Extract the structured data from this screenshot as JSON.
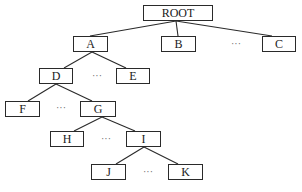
{
  "diagram": {
    "type": "tree",
    "nodes": [
      {
        "id": "root",
        "label": "ROOT",
        "x": 143,
        "y": 5,
        "w": 70,
        "h": 16
      },
      {
        "id": "a",
        "label": "A",
        "x": 73,
        "y": 36,
        "w": 35,
        "h": 16
      },
      {
        "id": "b",
        "label": "B",
        "x": 161,
        "y": 36,
        "w": 35,
        "h": 16
      },
      {
        "id": "c",
        "label": "C",
        "x": 262,
        "y": 36,
        "w": 34,
        "h": 16
      },
      {
        "id": "d",
        "label": "D",
        "x": 39,
        "y": 68,
        "w": 34,
        "h": 16
      },
      {
        "id": "e",
        "label": "E",
        "x": 116,
        "y": 68,
        "w": 34,
        "h": 16
      },
      {
        "id": "f",
        "label": "F",
        "x": 5,
        "y": 101,
        "w": 35,
        "h": 16
      },
      {
        "id": "g",
        "label": "G",
        "x": 80,
        "y": 101,
        "w": 36,
        "h": 16
      },
      {
        "id": "h",
        "label": "H",
        "x": 50,
        "y": 131,
        "w": 34,
        "h": 16
      },
      {
        "id": "i",
        "label": "I",
        "x": 126,
        "y": 131,
        "w": 35,
        "h": 16
      },
      {
        "id": "j",
        "label": "J",
        "x": 91,
        "y": 164,
        "w": 35,
        "h": 16
      },
      {
        "id": "k",
        "label": "K",
        "x": 168,
        "y": 164,
        "w": 35,
        "h": 16
      }
    ],
    "edges": [
      {
        "from": "root",
        "to": "a",
        "x1": 176,
        "y1": 21,
        "x2": 90,
        "y2": 36
      },
      {
        "from": "root",
        "to": "b",
        "x1": 176,
        "y1": 21,
        "x2": 178,
        "y2": 36
      },
      {
        "from": "root",
        "to": "c",
        "x1": 176,
        "y1": 21,
        "x2": 272,
        "y2": 36
      },
      {
        "from": "a",
        "to": "d",
        "x1": 92,
        "y1": 52,
        "x2": 64,
        "y2": 68
      },
      {
        "from": "a",
        "to": "e",
        "x1": 92,
        "y1": 52,
        "x2": 126,
        "y2": 68
      },
      {
        "from": "d",
        "to": "f",
        "x1": 56,
        "y1": 84,
        "x2": 28,
        "y2": 101
      },
      {
        "from": "d",
        "to": "g",
        "x1": 56,
        "y1": 84,
        "x2": 92,
        "y2": 101
      },
      {
        "from": "g",
        "to": "h",
        "x1": 102,
        "y1": 117,
        "x2": 74,
        "y2": 131
      },
      {
        "from": "g",
        "to": "i",
        "x1": 102,
        "y1": 117,
        "x2": 135,
        "y2": 131
      },
      {
        "from": "i",
        "to": "j",
        "x1": 144,
        "y1": 147,
        "x2": 116,
        "y2": 164
      },
      {
        "from": "i",
        "to": "k",
        "x1": 144,
        "y1": 147,
        "x2": 178,
        "y2": 164
      }
    ],
    "ellipses": [
      {
        "id": "dots-b-c",
        "label": "···",
        "x": 236,
        "y": 43
      },
      {
        "id": "dots-d-e",
        "label": "···",
        "x": 97,
        "y": 75
      },
      {
        "id": "dots-f-g",
        "label": "···",
        "x": 61,
        "y": 107
      },
      {
        "id": "dots-h-i",
        "label": "···",
        "x": 106,
        "y": 138
      },
      {
        "id": "dots-j-k",
        "label": "···",
        "x": 148,
        "y": 171
      }
    ]
  }
}
